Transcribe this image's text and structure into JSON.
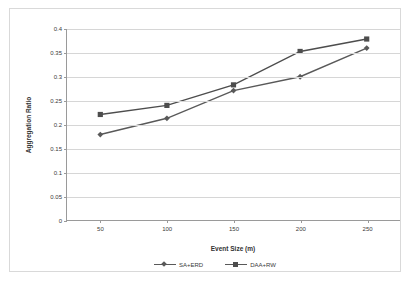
{
  "chart_data": {
    "type": "line",
    "title": "",
    "xlabel": "Event Size (m)",
    "ylabel": "Aggregation Ratio",
    "categories": [
      50,
      100,
      150,
      200,
      250
    ],
    "x": [
      50,
      100,
      150,
      200,
      250
    ],
    "xtick_labels": [
      "50",
      "100",
      "150",
      "200",
      "250"
    ],
    "ytick_labels": [
      "0",
      "0.05",
      "0.1",
      "0.15",
      "0.2",
      "0.25",
      "0.3",
      "0.35",
      "0.4"
    ],
    "ytick_values": [
      0,
      0.05,
      0.1,
      0.15,
      0.2,
      0.25,
      0.3,
      0.35,
      0.4
    ],
    "ylim": [
      0,
      0.4
    ],
    "xlim": [
      25,
      275
    ],
    "grid": "horizontal",
    "legend_position": "bottom",
    "series": [
      {
        "name": "SA+ERD",
        "marker": "diamond",
        "color": "#595959",
        "values": [
          0.179,
          0.213,
          0.271,
          0.3,
          0.36
        ]
      },
      {
        "name": "DAA+RW",
        "marker": "square",
        "color": "#4d4d4d",
        "values": [
          0.221,
          0.24,
          0.283,
          0.353,
          0.379
        ]
      }
    ]
  },
  "legend": {
    "items": [
      {
        "label": "SA+ERD",
        "marker": "diamond"
      },
      {
        "label": "DAA+RW",
        "marker": "square"
      }
    ]
  },
  "colors": {
    "series_1": "#595959",
    "series_2": "#4d4d4d",
    "gridline": "#d6d6d6",
    "axis": "#9a9a9a",
    "frame": "#d9d9d9",
    "text": "#3a3a3a"
  }
}
